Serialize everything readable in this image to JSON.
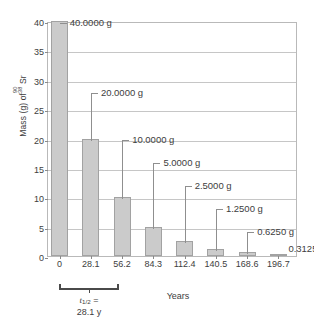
{
  "chart_data": {
    "type": "bar",
    "title": "",
    "xlabel": "Years",
    "ylabel_text": "Mass (g) of",
    "ylabel_nuclide": {
      "mass_number": "90",
      "atomic_number": "38",
      "symbol": "Sr"
    },
    "categories": [
      "0",
      "28.1",
      "56.2",
      "84.3",
      "112.4",
      "140.5",
      "168.6",
      "196.7"
    ],
    "x_values": [
      0,
      28.1,
      56.2,
      84.3,
      112.4,
      140.5,
      168.6,
      196.7
    ],
    "values": [
      40.0,
      20.0,
      10.0,
      5.0,
      2.5,
      1.25,
      0.625,
      0.3125
    ],
    "data_labels": [
      "40.0000 g",
      "20.0000 g",
      "10.0000 g",
      "5.0000 g",
      "2.5000 g",
      "1.2500 g",
      "0.6250 g",
      "0.3125 g"
    ],
    "ylim": [
      0,
      40
    ],
    "yticks": [
      0,
      5,
      10,
      15,
      20,
      25,
      30,
      35,
      40
    ],
    "ytick_labels": [
      "0",
      "5",
      "10",
      "15",
      "20",
      "25",
      "30",
      "35",
      "40"
    ],
    "grid": true,
    "legend": false,
    "bar_color": "#cbcbcb",
    "bar_edge_color": "#a2a2a2",
    "grid_color": "#c6c6c6",
    "text_color": "#3d3d3d"
  },
  "annotation": {
    "halflife_symbol": "t",
    "halflife_subscript": "1/2",
    "halflife_equals": " =",
    "halflife_value": "28.1 y",
    "bracket_from": "0",
    "bracket_to": "28.1"
  }
}
